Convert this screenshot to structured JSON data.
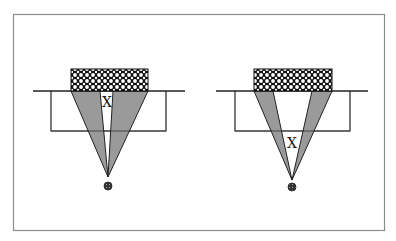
{
  "colors": {
    "background": "#ffffff",
    "frame": "#8c8c8c",
    "line": "#222222",
    "wedge_fill": "#9a9a9a",
    "hatch_bg": "#111111",
    "hatch_fg": "#ffffff",
    "dot": "#333333"
  },
  "diagram": {
    "panels": [
      {
        "id": "left",
        "label": "X",
        "description": "Converging cone with narrow white gap near top"
      },
      {
        "id": "right",
        "label": "X",
        "description": "Converging cone with wide white gap; X lower in gap"
      }
    ]
  }
}
